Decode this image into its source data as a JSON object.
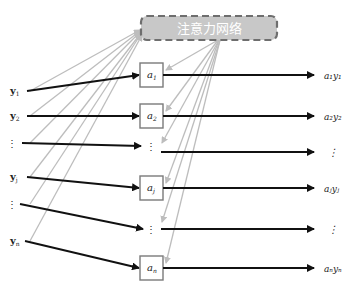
{
  "title": "注意力网络",
  "colors": {
    "attention_fill": "#c8c8c8",
    "attention_border": "#6e6e6e",
    "attention_text": "#ffffff",
    "grey_line": "#bdbdbd",
    "black_line": "#111111",
    "box_border": "#7a7a7a"
  },
  "inputs": [
    {
      "label": "y",
      "sub": "1",
      "y": 91
    },
    {
      "label": "y",
      "sub": "2",
      "y": 116
    },
    {
      "label": "⋮",
      "sub": "",
      "y": 143
    },
    {
      "label": "y",
      "sub": "j",
      "y": 177
    },
    {
      "label": "⋮",
      "sub": "",
      "y": 204
    },
    {
      "label": "y",
      "sub": "n",
      "y": 241
    }
  ],
  "weights": [
    {
      "label": "a",
      "sub": "1",
      "y": 75,
      "boxed": true
    },
    {
      "label": "a",
      "sub": "2",
      "y": 116,
      "boxed": true
    },
    {
      "label": "⋮",
      "sub": "",
      "y": 146,
      "boxed": false
    },
    {
      "label": "a",
      "sub": "j",
      "y": 188,
      "boxed": true
    },
    {
      "label": "⋮",
      "sub": "",
      "y": 229,
      "boxed": false
    },
    {
      "label": "a",
      "sub": "n",
      "y": 268,
      "boxed": true
    }
  ],
  "outputs": [
    {
      "label": "a₁y₁",
      "y": 75
    },
    {
      "label": "a₂y₂",
      "y": 116
    },
    {
      "label": "⋮",
      "y": 152
    },
    {
      "label": "aⱼyⱼ",
      "y": 188
    },
    {
      "label": "⋮",
      "y": 229
    },
    {
      "label": "aₙyₙ",
      "y": 268
    }
  ]
}
